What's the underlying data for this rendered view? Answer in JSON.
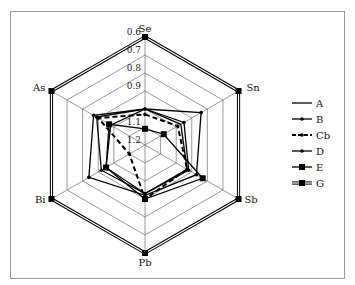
{
  "chart_data": {
    "type": "radar",
    "title": "",
    "axes": [
      "Se",
      "Sn",
      "Sb",
      "Pb",
      "Bi",
      "As"
    ],
    "radial_ticks": [
      "0.6",
      "0.7",
      "0.8",
      "0.9",
      "1",
      "1.1",
      "1.2"
    ],
    "radial_tick_labels_visible": [
      "0.6",
      "0.7",
      "0.8",
      "0.9",
      "1.1",
      "1.2"
    ],
    "range": [
      1.2,
      0.6
    ],
    "range_note": "center = 1.2, outer ring = 0.6 (inverted radial scale)",
    "grid": true,
    "legend_position": "right",
    "series": [
      {
        "name": "A",
        "style": "solid-line",
        "values": [
          1.0,
          0.97,
          0.93,
          0.93,
          0.95,
          0.98
        ]
      },
      {
        "name": "B",
        "style": "line-small-dot",
        "values": [
          1.0,
          0.84,
          0.87,
          0.92,
          0.84,
          0.87
        ]
      },
      {
        "name": "Cb",
        "style": "dashed-line-dot",
        "values": [
          1.03,
          0.99,
          0.93,
          0.9,
          1.1,
          0.9
        ]
      },
      {
        "name": "D",
        "style": "line-small-dot",
        "values": [
          1.0,
          0.95,
          0.92,
          0.93,
          0.92,
          0.89
        ]
      },
      {
        "name": "E",
        "style": "line-square-marker",
        "values": [
          1.11,
          1.08,
          0.83,
          0.9,
          0.95,
          0.97
        ]
      },
      {
        "name": "G",
        "style": "double-line-square",
        "values": [
          0.6,
          0.6,
          0.6,
          0.6,
          0.6,
          0.6
        ]
      }
    ]
  },
  "legend": {
    "items": [
      {
        "label": "A"
      },
      {
        "label": "B"
      },
      {
        "label": "Cb"
      },
      {
        "label": "D"
      },
      {
        "label": "E"
      },
      {
        "label": "G"
      }
    ]
  }
}
